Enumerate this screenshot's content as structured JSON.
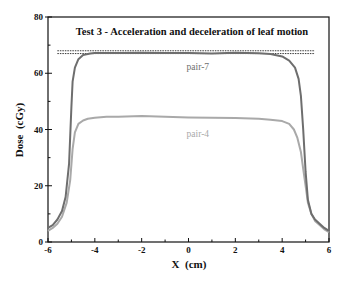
{
  "chart_data": {
    "type": "line",
    "title": "Test 3 - Acceleration and deceleration of leaf motion",
    "xlabel": "X  (cm)",
    "ylabel": "Dose  (cGy)",
    "xlim": [
      -6,
      6
    ],
    "ylim": [
      0,
      80
    ],
    "x_ticks": [
      -6,
      -4,
      -2,
      0,
      2,
      4,
      6
    ],
    "x_minor_ticks": [
      -5,
      -3,
      -1,
      1,
      3,
      5
    ],
    "y_ticks": [
      0,
      20,
      40,
      60,
      80
    ],
    "y_minor_ticks": [
      10,
      30,
      50,
      70
    ],
    "grid": false,
    "legend": "inline labels",
    "reference_lines": [
      {
        "style": "dashed",
        "y": 68,
        "x_range": [
          -5.6,
          5.4
        ]
      },
      {
        "style": "dashed",
        "y": 67,
        "x_range": [
          -5.6,
          5.4
        ]
      }
    ],
    "series": [
      {
        "name": "pair-7",
        "color": "#6e6e6e",
        "label_pos": {
          "x": 0.4,
          "y": 61
        },
        "x": [
          -6,
          -5.8,
          -5.6,
          -5.4,
          -5.25,
          -5.1,
          -5.0,
          -4.95,
          -4.85,
          -4.7,
          -4.5,
          -4.2,
          -4.0,
          -3,
          -2,
          -1,
          0,
          1,
          2,
          3,
          3.5,
          4,
          4.3,
          4.55,
          4.7,
          4.8,
          4.9,
          5.0,
          5.1,
          5.25,
          5.4,
          5.6,
          5.8,
          6
        ],
        "values": [
          5,
          6,
          8,
          11,
          16,
          28,
          48,
          57,
          62,
          65,
          66.5,
          67,
          67.2,
          67.2,
          67.3,
          67.2,
          67.2,
          67,
          67.3,
          67.1,
          66.8,
          66,
          64.5,
          62,
          58,
          52,
          40,
          25,
          15,
          10,
          8,
          6.5,
          5,
          4
        ]
      },
      {
        "name": "pair-4",
        "color": "#a9a9a9",
        "label_pos": {
          "x": 0.4,
          "y": 37.5
        },
        "x": [
          -6,
          -5.8,
          -5.6,
          -5.4,
          -5.2,
          -5.05,
          -4.95,
          -4.85,
          -4.7,
          -4.5,
          -4.3,
          -4.0,
          -3.5,
          -3,
          -2,
          -1,
          0,
          1,
          2,
          3,
          3.5,
          4.0,
          4.3,
          4.5,
          4.65,
          4.8,
          4.9,
          5.0,
          5.1,
          5.25,
          5.4,
          5.6,
          5.8,
          6
        ],
        "values": [
          4,
          5,
          6.5,
          9,
          14,
          22,
          33,
          39,
          42,
          43.2,
          43.8,
          44.2,
          44.5,
          44.5,
          44.8,
          44.5,
          44.3,
          44.2,
          44.1,
          43.8,
          43.5,
          43,
          42,
          40,
          37,
          32,
          26,
          20,
          14,
          10,
          7.5,
          6,
          4.5,
          3.5
        ]
      }
    ]
  }
}
